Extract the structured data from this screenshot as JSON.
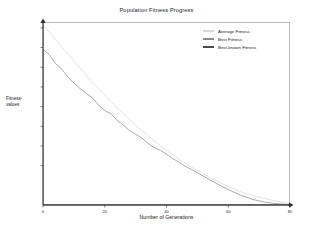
{
  "chart_data": {
    "type": "line",
    "title": "Population Fitness Progress",
    "xlabel": "Number of Generations",
    "ylabel": "Fitness-values",
    "ylabel_line1": "Fitness-",
    "ylabel_line2": "values",
    "xlim": [
      0,
      80
    ],
    "ylim": [
      0,
      46500
    ],
    "grid": false,
    "legend_position": "top-right",
    "xticks": [
      0,
      20,
      40,
      60,
      80
    ],
    "xtick_labels": [
      "0",
      "20",
      "40",
      "60",
      "80"
    ],
    "yticks": [
      10000,
      15000,
      20000,
      25000,
      30000,
      35000,
      40000,
      45000
    ],
    "ytick_labels": [
      "10000",
      "15000",
      "20000",
      "25000",
      "30000",
      "35000",
      "40000",
      "45000"
    ],
    "colors": {
      "average_fitness": "#d8d8d8",
      "best_fitness": "#8c8c8c",
      "best_known_fitness": "#4a4a4a",
      "axis": "#2b2b2b",
      "frame": "#b9b9b9"
    },
    "series": [
      {
        "name": "Average Fitness",
        "color": "#d8d8d8",
        "x": [
          0,
          2,
          4,
          6,
          8,
          10,
          12,
          14,
          16,
          18,
          20,
          22,
          24,
          26,
          28,
          30,
          32,
          34,
          36,
          38,
          40,
          42,
          44,
          46,
          48,
          50,
          52,
          54,
          56,
          58,
          60,
          64,
          68,
          72,
          76,
          80
        ],
        "values": [
          45800,
          43900,
          42100,
          40300,
          38400,
          36600,
          34800,
          33000,
          31300,
          29600,
          27900,
          26300,
          24700,
          23200,
          21700,
          20300,
          18900,
          17600,
          16300,
          15100,
          13900,
          12800,
          11700,
          10700,
          9700,
          8800,
          7900,
          7000,
          6200,
          5400,
          4700,
          3400,
          2400,
          1600,
          900,
          400
        ]
      },
      {
        "name": "Best Fitness",
        "color": "#8c8c8c",
        "x": [
          0,
          2,
          4,
          6,
          8,
          10,
          12,
          14,
          16,
          18,
          20,
          22,
          24,
          26,
          28,
          30,
          32,
          34,
          36,
          38,
          40,
          42,
          44,
          46,
          48,
          50,
          52,
          54,
          56,
          58,
          60,
          64,
          68,
          72,
          76,
          80
        ],
        "values": [
          39600,
          38200,
          36000,
          34600,
          32600,
          31000,
          29600,
          28400,
          27200,
          25400,
          24000,
          23200,
          21500,
          20300,
          18900,
          18000,
          17000,
          15700,
          14600,
          13900,
          12900,
          11800,
          10900,
          9900,
          9100,
          8200,
          7300,
          6400,
          5600,
          4700,
          3900,
          2500,
          1400,
          700,
          300,
          100
        ]
      },
      {
        "name": "Best-known Fitness",
        "color": "#4a4a4a",
        "x": [
          0,
          80
        ],
        "values": [
          0,
          0
        ]
      }
    ]
  },
  "legend": {
    "items": [
      {
        "label": "Average Fitness",
        "color": "#d8d8d8"
      },
      {
        "label": "Best Fitness",
        "color": "#8c8c8c"
      },
      {
        "label": "Best-known Fitness",
        "color": "#4a4a4a"
      }
    ]
  }
}
